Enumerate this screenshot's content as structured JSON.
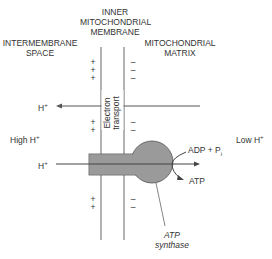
{
  "title_membrane": [
    "INNER",
    "MITOCHONDRIAL",
    "MEMBRANE"
  ],
  "left_region": [
    "INTERMEMBRANE",
    "SPACE"
  ],
  "right_region": [
    "MITOCHONDRIAL",
    "MATRIX"
  ],
  "electron_transport": [
    "Electron",
    "transport"
  ],
  "high_h": "High H",
  "low_h": "Low H",
  "h_plus": "H",
  "plus_sign": "+",
  "adp": "ADP + P",
  "adp_sub": "i",
  "atp": "ATP",
  "synthase": [
    "ATP",
    "synthase"
  ],
  "colors": {
    "line": "#555555",
    "synthase_fill": "#999999",
    "text": "#333333"
  }
}
